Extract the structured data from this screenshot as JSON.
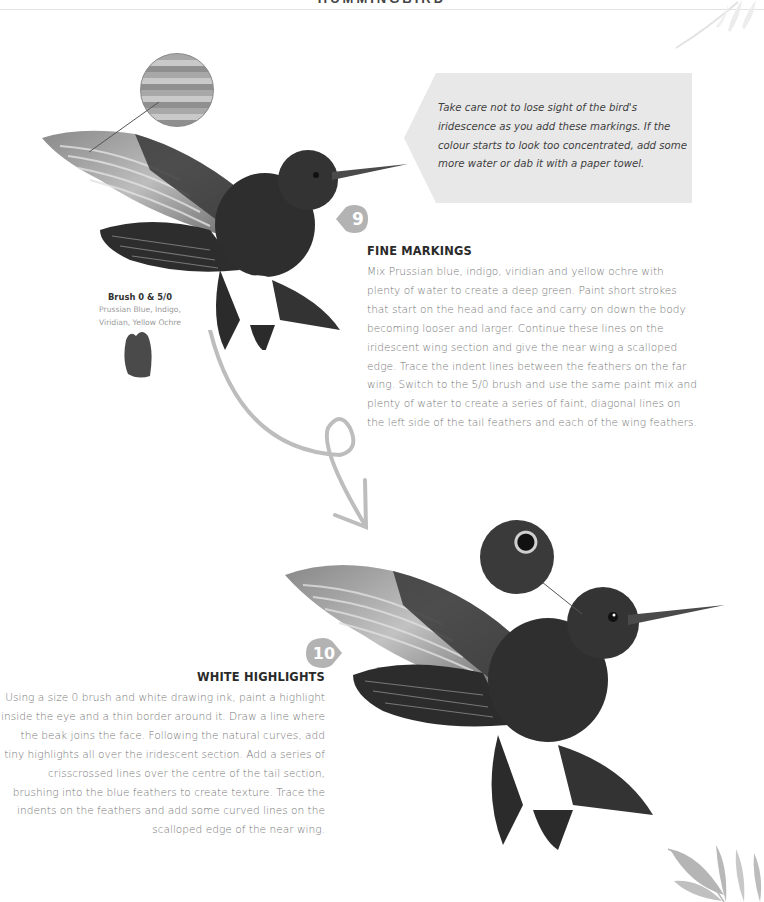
{
  "page": {
    "header_title": "HUMMINGBIRD",
    "colors": {
      "badge": "#b3b3b3",
      "callout_bg": "#e8e8e8",
      "arrow": "#bdbdbd",
      "body_text": "#777777",
      "heading_text": "#2a2a2a"
    }
  },
  "callout": {
    "text": "Take care not to lose sight of the bird's iridescence as you add these markings. If the colour starts to look too concentrated, add some more water or dab it with a paper towel."
  },
  "brush_info": {
    "title": "Brush 0 & 5/0",
    "colors_line1": "Prussian Blue, Indigo,",
    "colors_line2": "Viridian, Yellow Ochre"
  },
  "steps": [
    {
      "number": "9",
      "heading": "FINE MARKINGS",
      "body": "Mix Prussian blue, indigo, viridian and yellow ochre with plenty of water to create a deep green. Paint short strokes that start on the head and face and carry on down the body becoming looser and larger. Continue these lines on the iridescent wing section and give the near wing a scalloped edge. Trace the indent lines between the feathers on the far wing. Switch to the 5/0 brush and use the same paint mix and plenty of water to create a series of faint, diagonal lines on the left side of the tail feathers and each of the wing feathers."
    },
    {
      "number": "10",
      "heading": "WHITE HIGHLIGHTS",
      "body": "Using a size 0 brush and white drawing ink, paint a highlight inside the eye and a thin border around it. Draw a line where the beak joins the face. Following the natural curves, add tiny highlights all over the iridescent section. Add a series of crisscrossed lines over the centre of the tail section, brushing into the blue feathers to create texture. Trace the indents on the feathers and add some curved lines on the scalloped edge of the near wing."
    }
  ],
  "illustrations": {
    "bird_step9": "hummingbird-illustration-fine-markings",
    "bird_step10": "hummingbird-illustration-white-highlights",
    "detail_step9": "wing-feather-detail-circle",
    "detail_step10": "eye-detail-circle"
  }
}
